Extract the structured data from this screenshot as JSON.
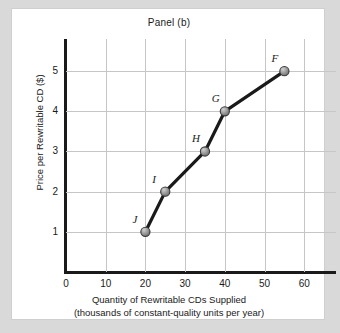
{
  "figure": {
    "title": "Panel (b)"
  },
  "chart_data": {
    "type": "line",
    "title": "Panel (b)",
    "xlabel_line1": "Quantity of Rewritable CDs Supplied",
    "xlabel_line2": "(thousands of constant-quality units per year)",
    "ylabel": "Price per Rewritable CD ($)",
    "xlim": [
      0,
      68
    ],
    "ylim": [
      0,
      5.8
    ],
    "grid": true,
    "legend": "none",
    "x_ticks": [
      0,
      10,
      20,
      30,
      40,
      50,
      60
    ],
    "x_tick_labels": [
      "0",
      "10",
      "20",
      "30",
      "40",
      "50",
      "60"
    ],
    "y_ticks": [
      1,
      2,
      3,
      4,
      5
    ],
    "y_tick_labels": [
      "1",
      "2",
      "3",
      "4",
      "5"
    ],
    "series": [
      {
        "name": "supply",
        "marker": "circle",
        "marker_color": "#8c8c8c",
        "line_color": "#1a1a1a",
        "points": [
          {
            "label": "J",
            "x": 20,
            "y": 1
          },
          {
            "label": "I",
            "x": 25,
            "y": 2
          },
          {
            "label": "H",
            "x": 35,
            "y": 3
          },
          {
            "label": "G",
            "x": 40,
            "y": 4
          },
          {
            "label": "F",
            "x": 55,
            "y": 5
          }
        ]
      }
    ]
  },
  "colors": {
    "page_background": "#d9d9d9",
    "card_background": "#ffffff",
    "card_border": "#cfcfcf",
    "axis": "#1a1a1a",
    "gridline": "#c6c6c6",
    "marker_fill": "#8c8c8c",
    "marker_edge": "#3a3a3a",
    "line": "#1a1a1a"
  }
}
